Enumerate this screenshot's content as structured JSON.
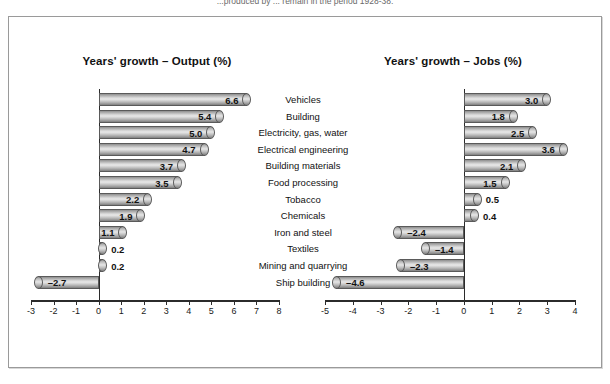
{
  "caption": "...produced by ... remain in the period 1928-38.",
  "chart_data": [
    {
      "type": "bar",
      "title": "Years' growth – Output (%)",
      "orientation": "horizontal",
      "xlabel": "",
      "ylabel": "",
      "xlim": [
        -3,
        8
      ],
      "xticks": [
        -3,
        -2,
        -1,
        0,
        1,
        2,
        3,
        4,
        5,
        6,
        7,
        8
      ],
      "xticklabels": [
        "-3",
        "-2",
        "-1",
        "0",
        "1",
        "2",
        "3",
        "4",
        "5",
        "6",
        "7",
        "8"
      ],
      "grid": false,
      "legend": false,
      "categories": [
        "Vehicles",
        "Building",
        "Electricity, gas, water",
        "Electrical engineering",
        "Building materials",
        "Food processing",
        "Tobacco",
        "Chemicals",
        "Iron and steel",
        "Textiles",
        "Mining and quarrying",
        "Ship building"
      ],
      "values": [
        6.6,
        5.4,
        5.0,
        4.7,
        3.7,
        3.5,
        2.2,
        1.9,
        1.1,
        0.2,
        0.2,
        -2.7
      ],
      "value_labels": [
        "6.6",
        "5.4",
        "5.0",
        "4.7",
        "3.7",
        "3.5",
        "2.2",
        "1.9",
        "1.1",
        "0.2",
        "0.2",
        "–2.7"
      ]
    },
    {
      "type": "bar",
      "title": "Years' growth – Jobs (%)",
      "orientation": "horizontal",
      "xlabel": "",
      "ylabel": "",
      "xlim": [
        -5,
        4
      ],
      "xticks": [
        -5,
        -4,
        -3,
        -2,
        -1,
        0,
        1,
        2,
        3,
        4
      ],
      "xticklabels": [
        "-5",
        "-4",
        "-3",
        "-2",
        "-1",
        "0",
        "1",
        "2",
        "3",
        "4"
      ],
      "grid": false,
      "legend": false,
      "categories": [
        "Vehicles",
        "Building",
        "Electricity, gas, water",
        "Electrical engineering",
        "Building materials",
        "Food processing",
        "Tobacco",
        "Chemicals",
        "Iron and steel",
        "Textiles",
        "Mining and quarrying",
        "Ship building"
      ],
      "values": [
        3.0,
        1.8,
        2.5,
        3.6,
        2.1,
        1.5,
        0.5,
        0.4,
        -2.4,
        -1.4,
        -2.3,
        -4.6
      ],
      "value_labels": [
        "3.0",
        "1.8",
        "2.5",
        "3.6",
        "2.1",
        "1.5",
        "0.5",
        "0.4",
        "–2.4",
        "–1.4",
        "–2.3",
        "–4.6"
      ]
    }
  ],
  "categories": [
    "Vehicles",
    "Building",
    "Electricity, gas, water",
    "Electrical engineering",
    "Building materials",
    "Food processing",
    "Tobacco",
    "Chemicals",
    "Iron and steel",
    "Textiles",
    "Mining and quarrying",
    "Ship building"
  ]
}
